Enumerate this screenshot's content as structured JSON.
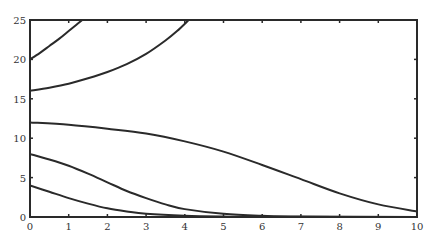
{
  "chart_data": {
    "type": "line",
    "title": "",
    "xlabel": "",
    "ylabel": "",
    "xlim": [
      0,
      10
    ],
    "ylim": [
      0,
      25
    ],
    "grid": false,
    "legend": null,
    "x_ticks": [
      "0",
      "1",
      "2",
      "3",
      "4",
      "5",
      "6",
      "7",
      "8",
      "9",
      "10"
    ],
    "y_ticks": [
      "0",
      "5",
      "10",
      "15",
      "20",
      "25"
    ],
    "series": [
      {
        "name": "curve-1",
        "x": [
          0,
          0.25,
          0.5,
          0.75,
          1.0,
          1.2,
          1.35
        ],
        "y": [
          20,
          20.8,
          21.7,
          22.6,
          23.6,
          24.4,
          25
        ]
      },
      {
        "name": "curve-2",
        "x": [
          0,
          0.5,
          1,
          1.5,
          2,
          2.5,
          3,
          3.5,
          3.8,
          4.1
        ],
        "y": [
          16,
          16.4,
          16.9,
          17.6,
          18.4,
          19.4,
          20.7,
          22.4,
          23.6,
          25
        ]
      },
      {
        "name": "curve-3",
        "x": [
          0,
          1,
          2,
          3,
          4,
          5,
          6,
          7,
          8,
          9,
          10
        ],
        "y": [
          12,
          11.7,
          11.2,
          10.6,
          9.6,
          8.3,
          6.6,
          4.8,
          3.0,
          1.6,
          0.7
        ]
      },
      {
        "name": "curve-4",
        "x": [
          0,
          0.5,
          1,
          1.5,
          2,
          2.5,
          3,
          3.5,
          4,
          5,
          6,
          7,
          10
        ],
        "y": [
          8,
          7.3,
          6.5,
          5.5,
          4.4,
          3.3,
          2.4,
          1.6,
          1.0,
          0.4,
          0.15,
          0.05,
          0
        ]
      },
      {
        "name": "curve-5",
        "x": [
          0,
          0.5,
          1,
          1.5,
          2,
          2.5,
          3,
          4,
          5,
          6,
          10
        ],
        "y": [
          4,
          3.2,
          2.4,
          1.7,
          1.1,
          0.7,
          0.4,
          0.15,
          0.05,
          0.02,
          0
        ]
      }
    ],
    "colors": {
      "line": "#2a2a2a",
      "axis": "#2a2a2a"
    }
  }
}
